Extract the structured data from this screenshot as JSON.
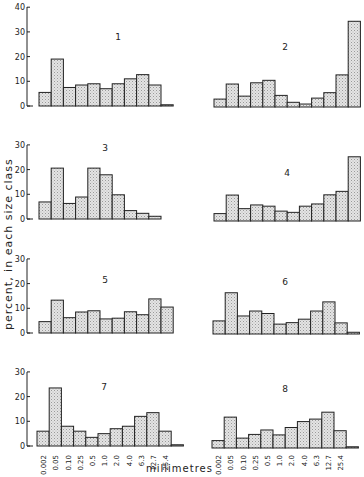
{
  "chart_data": {
    "type": "bar",
    "ylabel": "percent, in each size class",
    "xlabel": "millimetres",
    "categories": [
      "0.002",
      "0.05",
      "0.10",
      "0.25",
      "0.5",
      "1.0",
      "2.0",
      "4.0",
      "6.3",
      "12.7",
      "25.4"
    ],
    "grid": false,
    "panels": [
      {
        "id": "1",
        "ylim": [
          0,
          40
        ],
        "yticks": [
          0,
          10,
          20,
          30,
          40
        ],
        "values": [
          5.5,
          19,
          7.5,
          8.5,
          9,
          7,
          9,
          11,
          12.7,
          8.5,
          0.5
        ]
      },
      {
        "id": "2",
        "ylim": [
          0,
          40
        ],
        "values": [
          3.2,
          9.3,
          4.4,
          9.8,
          10.8,
          4.7,
          1.9,
          1.2,
          3.6,
          5.8,
          13,
          34.7
        ]
      },
      {
        "id": "3",
        "ylim": [
          0,
          30
        ],
        "yticks": [
          0,
          10,
          20,
          30
        ],
        "values": [
          6.9,
          20.6,
          6.3,
          8.9,
          20.6,
          17.9,
          9.8,
          3.4,
          2.3,
          1.1
        ]
      },
      {
        "id": "4",
        "ylim": [
          0,
          30
        ],
        "values": [
          3,
          10.5,
          5,
          6.5,
          6,
          4,
          3.5,
          6,
          6.9,
          10.6,
          12,
          26
        ]
      },
      {
        "id": "5",
        "ylim": [
          0,
          30
        ],
        "yticks": [
          0,
          10,
          20,
          30
        ],
        "values": [
          4.6,
          13.3,
          6.2,
          8.5,
          9,
          5.7,
          6,
          8.6,
          7.4,
          13.8,
          10.5
        ]
      },
      {
        "id": "6",
        "ylim": [
          0,
          30
        ],
        "values": [
          5.3,
          16.7,
          7.3,
          9.3,
          8.3,
          4,
          4.6,
          6,
          9.3,
          13,
          4.5,
          0.7
        ]
      },
      {
        "id": "7",
        "ylim": [
          0,
          30
        ],
        "yticks": [
          0,
          10,
          20,
          30
        ],
        "values": [
          6,
          23.5,
          8,
          6,
          3.5,
          5,
          7,
          8,
          12,
          13.5,
          6,
          0.5
        ]
      },
      {
        "id": "8",
        "ylim": [
          0,
          30
        ],
        "values": [
          3,
          12.5,
          4,
          5.5,
          7.3,
          5.3,
          8.3,
          10.7,
          11.7,
          14.5,
          7,
          0.5
        ]
      }
    ]
  },
  "labels": {
    "ylabel": "percent, in each size class",
    "xlabel": "millimetres"
  }
}
